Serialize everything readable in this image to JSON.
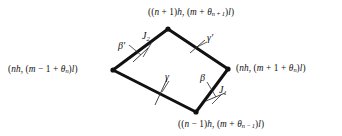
{
  "figure": {
    "type": "geometric-diagram",
    "shape": "quadrilateral-diamond",
    "background_color": "#ffffff",
    "edge_color": "#111111",
    "edge_width_px": 3,
    "leader_line_color": "#3a3a3a",
    "leader_line_width_px": 0.9,
    "vertices": [
      {
        "id": "top",
        "x": 168,
        "y": 29,
        "marker": "filled-dot"
      },
      {
        "id": "right",
        "x": 228,
        "y": 69,
        "marker": "filled-dot"
      },
      {
        "id": "bottom",
        "x": 196,
        "y": 112,
        "marker": "filled-dot"
      },
      {
        "id": "left",
        "x": 113,
        "y": 70,
        "marker": "filled-dot"
      }
    ],
    "edges": [
      {
        "id": "edge-top-left",
        "from": "left",
        "to": "top",
        "annotation": "beta-prime",
        "tick": true
      },
      {
        "id": "edge-top-right",
        "from": "top",
        "to": "right",
        "annotation": "gamma-prime",
        "tick": true
      },
      {
        "id": "edge-bottom-left",
        "from": "left",
        "to": "bottom",
        "annotation": "gamma",
        "tick": true
      },
      {
        "id": "edge-bottom-right",
        "from": "bottom",
        "to": "right",
        "annotation": "beta",
        "tick": true
      }
    ]
  },
  "vertex_labels": {
    "top": {
      "full": "((n + 1)h, (m + θn+1)l)",
      "parts": {
        "pre": "((",
        "n": "n",
        "plus1": " + 1)",
        "h": "h",
        "comma": ", (",
        "m": "m",
        "plus": " + ",
        "theta": "θ",
        "sub": "n + 1",
        "close": ")",
        "l": "l",
        "end": ")"
      }
    },
    "left": {
      "full": "(nh, (m − 1 + θn)l)",
      "parts": {
        "pre": "(",
        "n": "n",
        "h": "h",
        "comma": ", (",
        "m": "m",
        "minus1": " − 1 + ",
        "theta": "θ",
        "sub": "n",
        "close": ")",
        "l": "l",
        "end": ")"
      }
    },
    "right": {
      "full": "(nh, (m + 1 + θn)l)",
      "parts": {
        "pre": "(",
        "n": "n",
        "h": "h",
        "comma": ", (",
        "m": "m",
        "plus1": " + 1 + ",
        "theta": "θ",
        "sub": "n",
        "close": ")",
        "l": "l",
        "end": ")"
      }
    },
    "bottom": {
      "full": "((n − 1)h, (m + θn−1)l)",
      "parts": {
        "pre": "((",
        "n": "n",
        "minus1": " − 1)",
        "h": "h",
        "comma": ", (",
        "m": "m",
        "plus": " + ",
        "theta": "θ",
        "sub": "n − 1",
        "close": ")",
        "l": "l",
        "end": ")"
      }
    }
  },
  "edge_annotations": {
    "beta_prime": {
      "symbol": "β",
      "prime": "′",
      "full": "β′",
      "edge": "edge-top-left"
    },
    "gamma_prime": {
      "symbol": "γ",
      "prime": "′",
      "full": "γ′",
      "edge": "edge-top-right"
    },
    "gamma": {
      "symbol": "γ",
      "prime": "",
      "full": "γ",
      "edge": "edge-bottom-left"
    },
    "beta": {
      "symbol": "β",
      "prime": "",
      "full": "β",
      "edge": "edge-bottom-right"
    },
    "j1": {
      "symbol": "J",
      "sub": "1",
      "full": "J1",
      "edge": "edge-bottom-right"
    },
    "j2": {
      "symbol": "J",
      "sub": "2",
      "full": "J2",
      "edge": "edge-top-left"
    }
  }
}
